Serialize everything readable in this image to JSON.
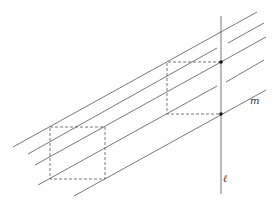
{
  "figure": {
    "labels": {
      "vertical_line": "ℓ",
      "line_m": "m"
    },
    "elements": {
      "parallel_lines": 5,
      "dashed_boxes": 2,
      "intersection_points": 2
    }
  }
}
